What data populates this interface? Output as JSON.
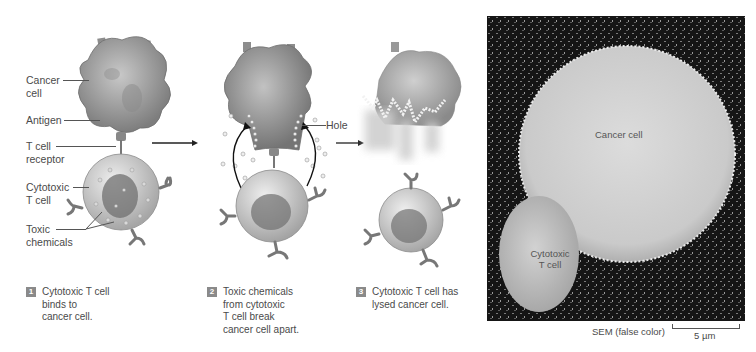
{
  "figure": {
    "panel_labels": {
      "cancer_cell": "Cancer\ncell",
      "cancer_cell_l1": "Cancer",
      "cancer_cell_l2": "cell",
      "antigen": "Antigen",
      "t_cell_receptor_l1": "T cell",
      "t_cell_receptor_l2": "receptor",
      "cytotoxic_t_cell_l1": "Cytotoxic",
      "cytotoxic_t_cell_l2": "T cell",
      "toxic_chemicals_l1": "Toxic",
      "toxic_chemicals_l2": "chemicals",
      "hole": "Hole"
    },
    "steps": [
      {
        "number": "1",
        "lines": [
          "Cytotoxic T cell",
          "binds to",
          "cancer cell."
        ]
      },
      {
        "number": "2",
        "lines": [
          "Toxic chemicals",
          "from cytotoxic",
          "T cell break",
          "cancer cell apart."
        ]
      },
      {
        "number": "3",
        "lines": [
          "Cytotoxic T cell has",
          "lysed cancer cell."
        ]
      }
    ],
    "micrograph": {
      "cancer_cell_label": "Cancer cell",
      "t_cell_label_l1": "Cytotoxic",
      "t_cell_label_l2": "T cell",
      "caption": "SEM (false color)",
      "scale_bar": "5 µm"
    }
  }
}
